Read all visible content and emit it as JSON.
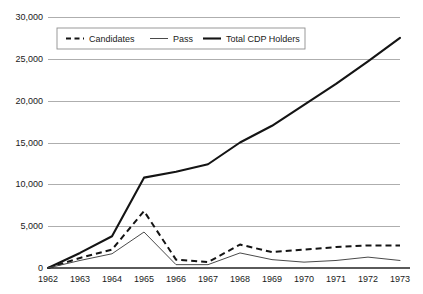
{
  "chart_data": {
    "type": "line",
    "title": "",
    "subtitle": "",
    "xlabel": "",
    "ylabel": "",
    "grid": true,
    "legend_position": "top-left-inside",
    "x": [
      "1962",
      "1963",
      "1964",
      "1965",
      "1966",
      "1967",
      "1968",
      "1969",
      "1970",
      "1971",
      "1972",
      "1973"
    ],
    "categories": [
      "1962",
      "1963",
      "1964",
      "1965",
      "1966",
      "1967",
      "1968",
      "1969",
      "1970",
      "1971",
      "1972",
      "1973"
    ],
    "xlim": [
      1962,
      1973
    ],
    "ylim": [
      0,
      30000
    ],
    "ytick_labels": [
      "30,000",
      "25,000",
      "20,000",
      "15,000",
      "10,000",
      "5,000",
      "0"
    ],
    "ytick_values": [
      30000,
      25000,
      20000,
      15000,
      10000,
      5000,
      0
    ],
    "xtick_labels": [
      "1962",
      "1963",
      "1964",
      "1965",
      "1966",
      "1967",
      "1968",
      "1969",
      "1970",
      "1971",
      "1972",
      "1973"
    ],
    "series": [
      {
        "name": "Candidates",
        "style": "dashed",
        "color": "#141414",
        "values": [
          0,
          1200,
          2200,
          6800,
          1000,
          700,
          2800,
          1900,
          2200,
          2500,
          2700,
          2700
        ]
      },
      {
        "name": "Pass",
        "style": "thin-solid",
        "color": "#4a4a4a",
        "values": [
          0,
          900,
          1700,
          4300,
          400,
          400,
          1800,
          1000,
          700,
          900,
          1300,
          900
        ]
      },
      {
        "name": "Total CDP Holders",
        "style": "thick-solid",
        "color": "#141414",
        "values": [
          0,
          1800,
          3800,
          10800,
          11500,
          12400,
          15000,
          17000,
          19500,
          22000,
          24700,
          27500
        ]
      }
    ],
    "legend": [
      {
        "label": "Candidates",
        "style": "dashed"
      },
      {
        "label": "Pass",
        "style": "thin-solid"
      },
      {
        "label": "Total CDP Holders",
        "style": "thick-solid"
      }
    ]
  },
  "colors": {
    "background": "#ffffff",
    "gridline": "#9a9a9a",
    "axis": "#5a5a5a",
    "text": "#1a1a1a",
    "series_dark": "#141414",
    "series_gray": "#4a4a4a",
    "legend_border": "#8f8f8f"
  }
}
